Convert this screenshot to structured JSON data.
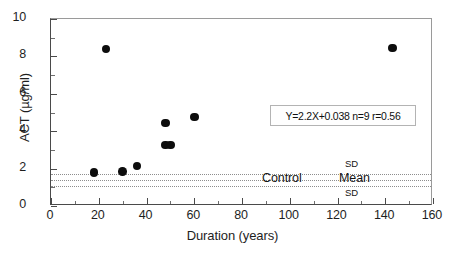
{
  "chart_data": {
    "type": "scatter",
    "title": "",
    "xlabel": "Duration (years)",
    "ylabel": "ACT (µg/ml)",
    "xlim": [
      0,
      160
    ],
    "ylim": [
      0,
      10
    ],
    "xticks": [
      0,
      20,
      40,
      60,
      80,
      100,
      120,
      140,
      160
    ],
    "xtick_labels": [
      "0",
      "20",
      "40",
      "60",
      "80",
      "100",
      "120",
      "140",
      "160"
    ],
    "x_minor_ticks": [
      10,
      30,
      50,
      70,
      90,
      110,
      130,
      150
    ],
    "yticks": [
      0,
      2,
      4,
      6,
      8,
      10
    ],
    "ytick_labels": [
      "0",
      "2",
      "4",
      "6",
      "8",
      "10"
    ],
    "y_minor_ticks": [
      1,
      3,
      5,
      7,
      9
    ],
    "grid": false,
    "legend": false,
    "marker": "filled-circle",
    "marker_color": "#0d0d0d",
    "points": [
      {
        "x": 18,
        "y": 1.8
      },
      {
        "x": 23,
        "y": 8.4
      },
      {
        "x": 30,
        "y": 1.85
      },
      {
        "x": 36,
        "y": 2.15
      },
      {
        "x": 48,
        "y": 4.45
      },
      {
        "x": 48,
        "y": 3.25
      },
      {
        "x": 50,
        "y": 3.25
      },
      {
        "x": 60,
        "y": 4.75
      },
      {
        "x": 143,
        "y": 8.45
      }
    ],
    "reference_lines": [
      {
        "label": "SD",
        "y": 1.7,
        "style": "dotted",
        "color": "#8d8d8d"
      },
      {
        "label": "Mean",
        "y": 1.4,
        "style": "dotted",
        "color": "#8d8d8d"
      },
      {
        "label": "SD",
        "y": 1.05,
        "style": "dotted",
        "color": "#8d8d8d"
      }
    ],
    "annotations": {
      "control_label": "Control",
      "mean_label": "Mean",
      "sd_upper_label": "SD",
      "sd_lower_label": "SD",
      "stats_text": "Y=2.2X+0.038  n=9  r=0.56",
      "regression_slope": 2.2,
      "regression_intercept": 0.038,
      "sample_size": 9,
      "correlation": 0.56
    }
  }
}
